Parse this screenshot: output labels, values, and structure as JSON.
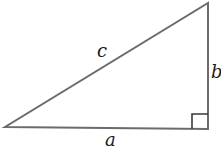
{
  "diagram": {
    "type": "right-triangle",
    "colors": {
      "stroke": "#6b6b6b",
      "text": "#1a1a1a",
      "background": "#ffffff"
    },
    "vertices": {
      "bottom_left": [
        5,
        127
      ],
      "bottom_right": [
        208,
        129
      ],
      "top_right": [
        208,
        3
      ]
    },
    "right_angle_marker": {
      "position": "bottom_right",
      "size": 15
    },
    "labels": {
      "hypotenuse": "c",
      "vertical_leg": "b",
      "horizontal_leg": "a"
    }
  }
}
